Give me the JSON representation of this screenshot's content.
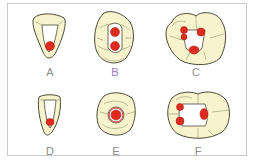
{
  "colors": {
    "crown": "#f7f3cc",
    "outline": "#4a4a3a",
    "groove": "#8f9a74",
    "access": "#ffffff",
    "orifice": "#e02a1e",
    "label": "#8a8a8a",
    "label_highlight": "#9a7bc0"
  },
  "panels": [
    {
      "id": "A",
      "label": "A",
      "tooth": "maxillary incisor",
      "orifices": 1
    },
    {
      "id": "B",
      "label": "B",
      "tooth": "maxillary premolar",
      "orifices": 2
    },
    {
      "id": "C",
      "label": "C",
      "tooth": "maxillary molar",
      "orifices": 4
    },
    {
      "id": "D",
      "label": "D",
      "tooth": "mandibular incisor",
      "orifices": 1
    },
    {
      "id": "E",
      "label": "E",
      "tooth": "mandibular premolar",
      "orifices": 1
    },
    {
      "id": "F",
      "label": "F",
      "tooth": "mandibular molar",
      "orifices": 3
    }
  ]
}
